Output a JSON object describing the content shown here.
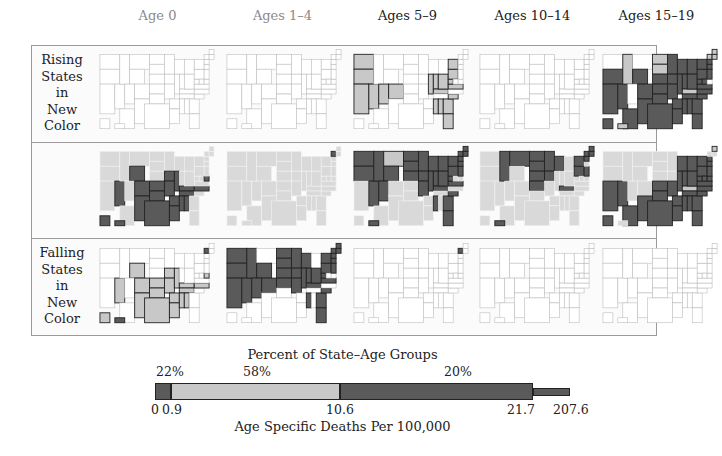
{
  "column_headers": [
    {
      "label": "Age 0",
      "muted": true
    },
    {
      "label": "Ages 1–4",
      "muted": true
    },
    {
      "label": "Ages 5–9",
      "muted": false
    },
    {
      "label": "Ages 10–14",
      "muted": false
    },
    {
      "label": "Ages 15–19",
      "muted": false
    }
  ],
  "row_labels": {
    "rising": [
      "Rising",
      "States",
      "in",
      "New",
      "Color"
    ],
    "falling": [
      "Falling",
      "States",
      "in",
      "New",
      "Color"
    ]
  },
  "colors": {
    "level_0": "#ffffff",
    "level_1": "#c8c8c8",
    "level_2": "#5a5a5a",
    "background": "#d9d9d9",
    "outline_light": "#bdbdbd",
    "outline_dark": "#222222"
  },
  "chart_data": {
    "type": "heatmap",
    "rows": [
      "Rising States in New Color",
      "All States",
      "Falling States in New Color"
    ],
    "columns": [
      "Age 0",
      "Ages 1–4",
      "Ages 5–9",
      "Ages 10–14",
      "Ages 15–19"
    ],
    "class_levels": [
      {
        "level": 2,
        "range": [
          0,
          0.9
        ],
        "percent_label": "22%"
      },
      {
        "level": 1,
        "range": [
          0.9,
          10.6
        ],
        "percent_label": "58%"
      },
      {
        "level": 2,
        "range": [
          10.6,
          21.7
        ],
        "percent_label": "20%"
      },
      {
        "level": 2,
        "range": [
          21.7,
          207.6
        ],
        "percent_label": ""
      }
    ],
    "maps": {
      "rising": [
        {
          "highlighted": {}
        },
        {
          "highlighted": {}
        },
        {
          "highlighted": {
            "WA": 1,
            "OR": 1,
            "CA": 1,
            "NV": 1,
            "UT": 1,
            "CO": 1,
            "IL": 1,
            "IN": 1,
            "OH": 1,
            "PA": 1,
            "NY": 1,
            "WV": 1,
            "VA": 1,
            "KY": 1,
            "MS": 1,
            "AL": 1,
            "GA": 1,
            "SC": 1,
            "FL": 1
          }
        },
        {
          "highlighted": {}
        },
        {
          "highlighted": {
            "CA": 2,
            "AZ": 2,
            "NM": 2,
            "TX": 2,
            "OK": 2,
            "KS": 2,
            "CO": 2,
            "NV": 2,
            "OR": 2,
            "WY": 2,
            "MO": 2,
            "AR": 2,
            "LA": 2,
            "MS": 2,
            "AL": 2,
            "GA": 2,
            "FL": 2,
            "TN": 2,
            "SC": 2,
            "NC": 2,
            "VA": 2,
            "WV": 2,
            "OH": 2,
            "IN": 2,
            "IL": 2,
            "MI": 2,
            "WI": 2,
            "PA": 2,
            "NY": 2,
            "MD": 2,
            "NJ": 2,
            "MN": 2,
            "IA": 2,
            "NE": 2,
            "SD": 1,
            "ND": 1,
            "ID": 1,
            "MT": 0,
            "UT": 0,
            "KY": 1,
            "ME": 1,
            "VT": 1,
            "NH": 1,
            "MA": 2,
            "CT": 2,
            "AK": 2,
            "HI": 1
          }
        }
      ],
      "all": [
        {
          "highlighted": {
            "NV": 2,
            "WY": 2,
            "CO": 2,
            "NM": 2,
            "TX": 2,
            "OK": 2,
            "KS": 2,
            "MO": 2,
            "AR": 2,
            "LA": 2,
            "MS": 2,
            "AL": 2,
            "TN": 2,
            "KY": 2,
            "NC": 2,
            "IA": 2,
            "IL": 2,
            "DE": 2,
            "AK": 2,
            "HI": 2
          }
        },
        {
          "highlighted": {
            "VT": 2
          }
        },
        {
          "highlighted": {
            "WA": 2,
            "OR": 2,
            "ID": 2,
            "NV": 2,
            "MT": 1,
            "WY": 2,
            "UT": 2,
            "ND": 2,
            "SD": 2,
            "NE": 2,
            "MN": 2,
            "IA": 2,
            "WI": 2,
            "MI": 2,
            "IL": 2,
            "IN": 2,
            "OH": 2,
            "PA": 2,
            "NY": 2,
            "ME": 2,
            "NH": 2,
            "VT": 2,
            "MA": 2,
            "CT": 2,
            "NJ": 2,
            "WV": 2,
            "VA": 2,
            "KY": 2,
            "MO": 2,
            "MS": 2,
            "GA": 2,
            "SC": 2,
            "FL": 2,
            "HI": 2
          }
        },
        {
          "highlighted": {
            "ID": 2,
            "MT": 2,
            "ND": 2,
            "SD": 2,
            "NE": 2,
            "MN": 2,
            "WI": 2,
            "IA": 2,
            "KS": 2,
            "KY": 2,
            "NY": 2,
            "ME": 2,
            "NH": 2,
            "VT": 2,
            "MA": 2,
            "PA": 2,
            "NJ": 2,
            "HI": 2
          }
        },
        {
          "highlighted": {
            "CA": 2,
            "NV": 2,
            "AZ": 2,
            "NM": 2,
            "TX": 2,
            "OK": 2,
            "KS": 2,
            "MO": 2,
            "AR": 2,
            "LA": 2,
            "MS": 2,
            "AL": 2,
            "GA": 2,
            "FL": 2,
            "TN": 2,
            "SC": 2,
            "NC": 2,
            "VA": 2,
            "WV": 2,
            "OH": 2,
            "IN": 2,
            "IL": 2,
            "MI": 2,
            "WI": 2,
            "PA": 2,
            "NY": 2,
            "MD": 2,
            "NJ": 2,
            "MA": 2,
            "CT": 2,
            "DE": 2,
            "AK": 2,
            "ME": 1,
            "KY": 1
          }
        }
      ],
      "falling": [
        {
          "highlighted": {
            "NV": 1,
            "WY": 1,
            "CO": 1,
            "NM": 1,
            "TX": 1,
            "OK": 1,
            "KS": 1,
            "MO": 1,
            "AR": 1,
            "LA": 1,
            "MS": 1,
            "AL": 1,
            "TN": 1,
            "KY": 1,
            "NC": 1,
            "IA": 1,
            "IL": 1,
            "DE": 1,
            "VT": 2,
            "AK": 1,
            "HI": 2
          }
        },
        {
          "highlighted": {
            "WA": 2,
            "OR": 2,
            "ID": 2,
            "NV": 2,
            "CA": 2,
            "WY": 2,
            "UT": 2,
            "CO": 2,
            "ND": 2,
            "SD": 2,
            "NE": 2,
            "KS": 2,
            "MN": 2,
            "IA": 2,
            "WI": 2,
            "IL": 2,
            "IN": 2,
            "OH": 2,
            "PA": 2,
            "NY": 2,
            "ME": 2,
            "NH": 2,
            "VT": 2,
            "MA": 2,
            "CT": 2,
            "NJ": 2,
            "WV": 2,
            "VA": 2,
            "KY": 2,
            "MO": 2,
            "MS": 2,
            "GA": 2,
            "SC": 2,
            "FL": 2
          }
        },
        {
          "highlighted": {
            "VT": 2
          }
        },
        {
          "highlighted": {}
        },
        {
          "highlighted": {}
        }
      ]
    },
    "legend": {
      "title": "Percent of State–Age Groups",
      "xlabel": "Age Specific Deaths Per 100,000",
      "percent_labels": [
        "22%",
        "58%",
        "20%"
      ],
      "tick_labels": [
        "0",
        "0.9",
        "10.6",
        "21.7",
        "207.6"
      ],
      "breaks": [
        0,
        0.9,
        10.6,
        21.7,
        207.6
      ],
      "segments": [
        {
          "from": 0,
          "to": 0.9,
          "level": 2,
          "percent": 22
        },
        {
          "from": 0.9,
          "to": 10.6,
          "level": 1,
          "percent": 58
        },
        {
          "from": 10.6,
          "to": 21.7,
          "level": 2,
          "percent": 20
        },
        {
          "from": 21.7,
          "to": 207.6,
          "level": 2,
          "percent": null
        }
      ]
    }
  }
}
